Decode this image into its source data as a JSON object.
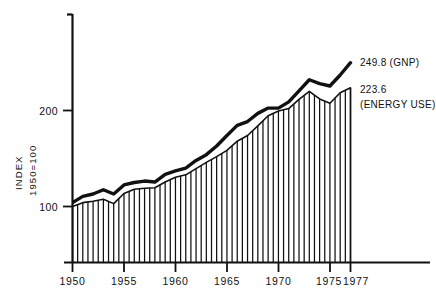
{
  "chart_data": {
    "type": "line",
    "title": "",
    "subtitle": "",
    "xlabel": "",
    "ylabel": "INDEX 1950=100",
    "ylabel_line1": "INDEX",
    "ylabel_line2": "1950=100",
    "grid": false,
    "legend_position": "right-inline-annotations",
    "xlim": [
      1950,
      1977
    ],
    "ylim": [
      55,
      262
    ],
    "x_tick_labels": [
      "1950",
      "1955",
      "1960",
      "1965",
      "1970",
      "1975",
      "1977"
    ],
    "x_ticks": [
      1950,
      1955,
      1960,
      1965,
      1970,
      1975,
      1977
    ],
    "y_tick_labels": [
      "100",
      "200"
    ],
    "y_ticks": [
      100,
      200
    ],
    "x": [
      1950,
      1951,
      1952,
      1953,
      1954,
      1955,
      1956,
      1957,
      1958,
      1959,
      1960,
      1961,
      1962,
      1963,
      1964,
      1965,
      1966,
      1967,
      1968,
      1969,
      1970,
      1971,
      1972,
      1973,
      1974,
      1975,
      1976,
      1977
    ],
    "series": [
      {
        "name": "GNP",
        "style": "thick-line",
        "end_label": "249.8 (GNP)",
        "end_value": 249.8,
        "values": [
          104.0,
          110.5,
          113.0,
          117.5,
          113.0,
          122.5,
          125.0,
          126.5,
          125.5,
          133.5,
          137.0,
          140.0,
          148.0,
          154.0,
          163.0,
          174.0,
          184.5,
          188.5,
          197.0,
          202.5,
          202.5,
          209.0,
          220.5,
          232.0,
          228.0,
          225.5,
          237.0,
          249.8
        ]
      },
      {
        "name": "ENERGY USE",
        "style": "vertical-hatched-bars",
        "end_label_line1": "223.6",
        "end_label_line2": "(ENERGY USE)",
        "end_value": 223.6,
        "values": [
          100.0,
          104.0,
          105.5,
          107.5,
          103.0,
          113.5,
          118.0,
          119.0,
          119.5,
          125.5,
          130.5,
          133.0,
          139.5,
          146.0,
          152.0,
          158.5,
          168.0,
          174.0,
          184.0,
          194.5,
          199.5,
          202.0,
          211.5,
          220.0,
          212.0,
          207.5,
          218.5,
          223.6
        ]
      }
    ],
    "annotations": [
      {
        "text": "249.8 (GNP)",
        "series": "GNP",
        "at_x": 1977
      },
      {
        "text": "223.6 (ENERGY USE)",
        "series": "ENERGY USE",
        "at_x": 1977
      }
    ]
  },
  "axis": {
    "y_label_line1": "INDEX",
    "y_label_line2": "1950=100",
    "y_tick_100": "100",
    "y_tick_200": "200",
    "x_tick_1950": "1950",
    "x_tick_1955": "1955",
    "x_tick_1960": "1960",
    "x_tick_1965": "1965",
    "x_tick_1970": "1970",
    "x_tick_1975": "1975",
    "x_tick_1977": "1977"
  },
  "labels": {
    "gnp_end": "249.8 (GNP)",
    "energy_end_line1": "223.6",
    "energy_end_line2": "(ENERGY USE)"
  },
  "colors": {
    "ink": "#111111",
    "background": "#ffffff"
  }
}
